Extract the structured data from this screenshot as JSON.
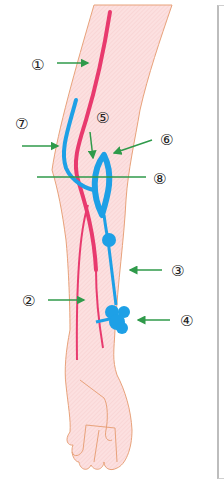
{
  "diagram": {
    "labels": [
      {
        "id": "1",
        "text": "①"
      },
      {
        "id": "2",
        "text": "②"
      },
      {
        "id": "3",
        "text": "③"
      },
      {
        "id": "4",
        "text": "④"
      },
      {
        "id": "5",
        "text": "⑤"
      },
      {
        "id": "6",
        "text": "⑥"
      },
      {
        "id": "7",
        "text": "⑦"
      },
      {
        "id": "8",
        "text": "⑧"
      }
    ],
    "colors": {
      "skin_fill": "#fbdada",
      "skin_outline": "#e8a27a",
      "artery": "#e83a6e",
      "vein": "#1ea0e6",
      "arrow": "#2f9a4a",
      "panel_border": "#bdbdbd"
    }
  }
}
